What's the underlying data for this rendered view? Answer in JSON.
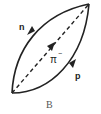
{
  "diagram": {
    "type": "feynman-diagram",
    "caption": "B",
    "lines": [
      {
        "id": "n",
        "label": "n",
        "style": "solid",
        "direction": "down-left"
      },
      {
        "id": "pi",
        "label": "π",
        "superscript": "−",
        "style": "dashed",
        "direction": "up-right"
      },
      {
        "id": "p",
        "label": "p",
        "style": "solid",
        "direction": "up-right"
      }
    ],
    "colors": {
      "line": "#222222",
      "caption": "#555555",
      "background": "#ffffff"
    }
  }
}
